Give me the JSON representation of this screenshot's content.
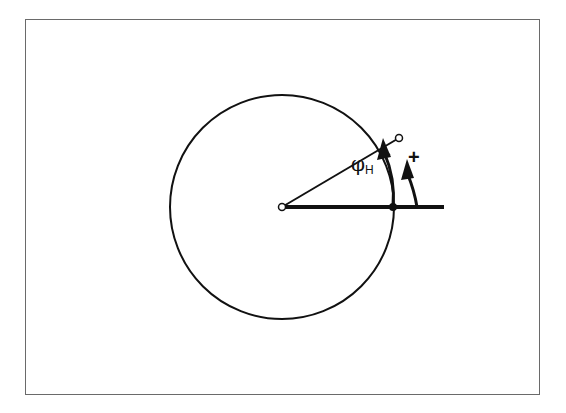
{
  "diagram": {
    "title": "",
    "labels": {
      "angle_symbol": "φ",
      "angle_subscript": "H",
      "direction_sign": "+"
    },
    "geometry": {
      "center": [
        282,
        207
      ],
      "radius": 112,
      "reference_line_end": [
        444,
        207
      ],
      "point_on_circle": [
        399,
        138
      ],
      "reference_point": [
        393,
        207
      ]
    },
    "colors": {
      "stroke": "#111111",
      "frame": "#6a6a6a",
      "background": "#ffffff"
    }
  }
}
